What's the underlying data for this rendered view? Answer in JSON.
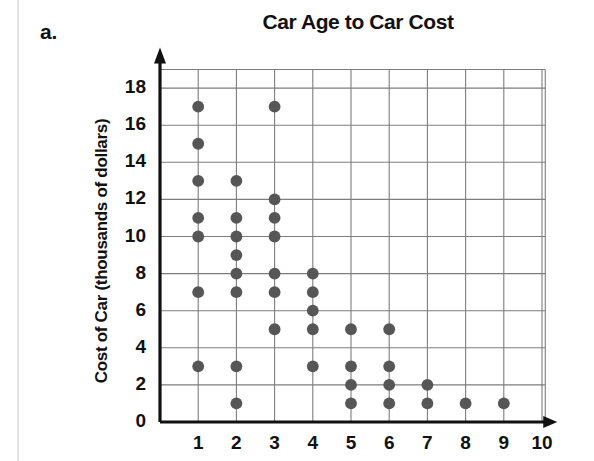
{
  "problem_label": "a.",
  "axis_colors": {
    "axis": "#111111",
    "grid": "#7d7d7d",
    "dot": "#565656",
    "page_edge": "#e2e2e2"
  },
  "chart_data": {
    "type": "scatter",
    "title": "Car Age to Car Cost",
    "xlabel": "",
    "ylabel": "Cost of Car (thousands of dollars)",
    "xlim": [
      0,
      10
    ],
    "ylim": [
      0,
      19
    ],
    "xticks": [
      "1",
      "2",
      "3",
      "4",
      "5",
      "6",
      "7",
      "8",
      "9",
      "10"
    ],
    "xtick_values": [
      1,
      2,
      3,
      4,
      5,
      6,
      7,
      8,
      9,
      10
    ],
    "yticks": [
      "0",
      "2",
      "4",
      "6",
      "8",
      "10",
      "12",
      "14",
      "16",
      "18"
    ],
    "ytick_values": [
      0,
      2,
      4,
      6,
      8,
      10,
      12,
      14,
      16,
      18
    ],
    "grid": "both",
    "grid_x_values": [
      1,
      2,
      3,
      4,
      5,
      6,
      7,
      8,
      9,
      10
    ],
    "grid_y_values": [
      2,
      4,
      6,
      8,
      10,
      12,
      14,
      16,
      18
    ],
    "legend": "none",
    "points": [
      {
        "x": 1,
        "y": 17
      },
      {
        "x": 1,
        "y": 15
      },
      {
        "x": 1,
        "y": 13
      },
      {
        "x": 1,
        "y": 11
      },
      {
        "x": 1,
        "y": 10
      },
      {
        "x": 1,
        "y": 7
      },
      {
        "x": 1,
        "y": 3
      },
      {
        "x": 2,
        "y": 13
      },
      {
        "x": 2,
        "y": 11
      },
      {
        "x": 2,
        "y": 10
      },
      {
        "x": 2,
        "y": 9
      },
      {
        "x": 2,
        "y": 8
      },
      {
        "x": 2,
        "y": 7
      },
      {
        "x": 2,
        "y": 3
      },
      {
        "x": 2,
        "y": 1
      },
      {
        "x": 3,
        "y": 17
      },
      {
        "x": 3,
        "y": 12
      },
      {
        "x": 3,
        "y": 11
      },
      {
        "x": 3,
        "y": 10
      },
      {
        "x": 3,
        "y": 8
      },
      {
        "x": 3,
        "y": 7
      },
      {
        "x": 3,
        "y": 5
      },
      {
        "x": 4,
        "y": 8
      },
      {
        "x": 4,
        "y": 7
      },
      {
        "x": 4,
        "y": 6
      },
      {
        "x": 4,
        "y": 5
      },
      {
        "x": 4,
        "y": 3
      },
      {
        "x": 5,
        "y": 5
      },
      {
        "x": 5,
        "y": 3
      },
      {
        "x": 5,
        "y": 2
      },
      {
        "x": 5,
        "y": 1
      },
      {
        "x": 6,
        "y": 5
      },
      {
        "x": 6,
        "y": 3
      },
      {
        "x": 6,
        "y": 2
      },
      {
        "x": 6,
        "y": 1
      },
      {
        "x": 7,
        "y": 2
      },
      {
        "x": 7,
        "y": 1
      },
      {
        "x": 8,
        "y": 1
      },
      {
        "x": 9,
        "y": 1
      }
    ]
  }
}
